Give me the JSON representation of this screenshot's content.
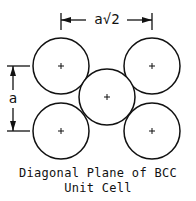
{
  "diagram": {
    "title_line1": "Diagonal Plane of BCC",
    "title_line2": "Unit Cell",
    "dim_horizontal_label": "a√2",
    "dim_vertical_label": "a",
    "atoms": [
      {
        "name": "corner-top-left",
        "cx": 61,
        "cy": 66
      },
      {
        "name": "corner-top-right",
        "cx": 152,
        "cy": 66
      },
      {
        "name": "body-center",
        "cx": 107,
        "cy": 97
      },
      {
        "name": "corner-bottom-left",
        "cx": 61,
        "cy": 131
      },
      {
        "name": "corner-bottom-right",
        "cx": 152,
        "cy": 131
      }
    ],
    "center_mark": "+",
    "line_color": "#111111"
  }
}
